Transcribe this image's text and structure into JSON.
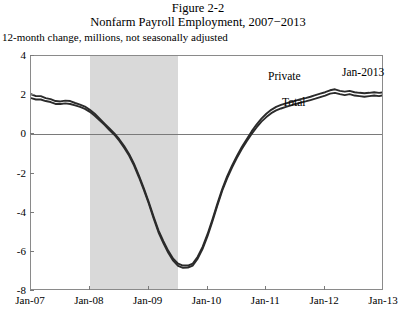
{
  "figure": {
    "number": "Figure 2-2",
    "title": "Nonfarm Payroll Employment, 2007−2013",
    "axis_note": "12-month change, millions, not seasonally adjusted"
  },
  "annotations": {
    "private": "Private",
    "total": "Total",
    "endpoint": "Jan-2013"
  },
  "colors": {
    "line": "#2b2b2b",
    "shade": "#d9d9d9",
    "axis": "#8a8a8a",
    "zero": "#7a7a7a",
    "background": "#ffffff"
  },
  "chart_data": {
    "type": "line",
    "title": "Nonfarm Payroll Employment, 2007−2013",
    "subtitle": "Figure 2-2",
    "ylabel": "12-month change, millions, not seasonally adjusted",
    "xlabel": "",
    "ylim": [
      -8,
      4
    ],
    "yticks": [
      4,
      2,
      0,
      -2,
      -4,
      -6,
      -8
    ],
    "ytick_labels": [
      "4",
      "2",
      "0",
      "-2",
      "-4",
      "-6",
      "-8"
    ],
    "xlim": [
      "Jan-07",
      "Jan-13"
    ],
    "xticks": [
      "Jan-07",
      "Jan-08",
      "Jan-09",
      "Jan-10",
      "Jan-11",
      "Jan-12",
      "Jan-13"
    ],
    "xtick_labels": [
      "Jan-07",
      "Jan-08",
      "Jan-09",
      "Jan-10",
      "Jan-11",
      "Jan-12",
      "Jan-13"
    ],
    "grid": false,
    "legend": "inline-labels",
    "zero_line": true,
    "shaded_region": {
      "label": "recession",
      "start": "Jan-2008",
      "end": "Jul-2009"
    },
    "x": [
      "Jan-07",
      "Feb-07",
      "Mar-07",
      "Apr-07",
      "May-07",
      "Jun-07",
      "Jul-07",
      "Aug-07",
      "Sep-07",
      "Oct-07",
      "Nov-07",
      "Dec-07",
      "Jan-08",
      "Feb-08",
      "Mar-08",
      "Apr-08",
      "May-08",
      "Jun-08",
      "Jul-08",
      "Aug-08",
      "Sep-08",
      "Oct-08",
      "Nov-08",
      "Dec-08",
      "Jan-09",
      "Feb-09",
      "Mar-09",
      "Apr-09",
      "May-09",
      "Jun-09",
      "Jul-09",
      "Aug-09",
      "Sep-09",
      "Oct-09",
      "Nov-09",
      "Dec-09",
      "Jan-10",
      "Feb-10",
      "Mar-10",
      "Apr-10",
      "May-10",
      "Jun-10",
      "Jul-10",
      "Aug-10",
      "Sep-10",
      "Oct-10",
      "Nov-10",
      "Dec-10",
      "Jan-11",
      "Feb-11",
      "Mar-11",
      "Apr-11",
      "May-11",
      "Jun-11",
      "Jul-11",
      "Aug-11",
      "Sep-11",
      "Oct-11",
      "Nov-11",
      "Dec-11",
      "Jan-12",
      "Feb-12",
      "Mar-12",
      "Apr-12",
      "May-12",
      "Jun-12",
      "Jul-12",
      "Aug-12",
      "Sep-12",
      "Oct-12",
      "Nov-12",
      "Dec-12",
      "Jan-13"
    ],
    "series": [
      {
        "name": "Private",
        "values": [
          2.05,
          1.95,
          1.95,
          1.85,
          1.8,
          1.7,
          1.68,
          1.72,
          1.7,
          1.6,
          1.52,
          1.42,
          1.25,
          1.05,
          0.8,
          0.55,
          0.3,
          0.05,
          -0.25,
          -0.6,
          -1.0,
          -1.5,
          -2.1,
          -2.75,
          -3.45,
          -4.2,
          -4.9,
          -5.45,
          -5.95,
          -6.35,
          -6.6,
          -6.7,
          -6.7,
          -6.6,
          -6.25,
          -5.75,
          -5.1,
          -4.35,
          -3.55,
          -2.8,
          -2.15,
          -1.6,
          -1.1,
          -0.65,
          -0.25,
          0.15,
          0.5,
          0.8,
          1.05,
          1.25,
          1.4,
          1.5,
          1.58,
          1.65,
          1.72,
          1.8,
          1.85,
          1.92,
          2.0,
          2.08,
          2.15,
          2.25,
          2.3,
          2.22,
          2.18,
          2.22,
          2.15,
          2.12,
          2.1,
          2.12,
          2.15,
          2.12,
          2.15
        ]
      },
      {
        "name": "Total",
        "values": [
          1.85,
          1.78,
          1.78,
          1.7,
          1.65,
          1.55,
          1.55,
          1.58,
          1.55,
          1.48,
          1.4,
          1.3,
          1.15,
          0.95,
          0.72,
          0.48,
          0.22,
          -0.02,
          -0.32,
          -0.68,
          -1.08,
          -1.58,
          -2.18,
          -2.82,
          -3.52,
          -4.28,
          -5.0,
          -5.55,
          -6.05,
          -6.45,
          -6.72,
          -6.82,
          -6.8,
          -6.7,
          -6.35,
          -5.85,
          -5.2,
          -4.45,
          -3.65,
          -2.88,
          -2.25,
          -1.7,
          -1.2,
          -0.75,
          -0.35,
          0.02,
          0.35,
          0.65,
          0.88,
          1.08,
          1.22,
          1.32,
          1.4,
          1.48,
          1.55,
          1.62,
          1.68,
          1.75,
          1.82,
          1.9,
          1.98,
          2.08,
          2.12,
          2.05,
          2.0,
          2.05,
          1.98,
          1.95,
          1.92,
          1.95,
          1.98,
          1.95,
          2.0
        ]
      }
    ]
  }
}
